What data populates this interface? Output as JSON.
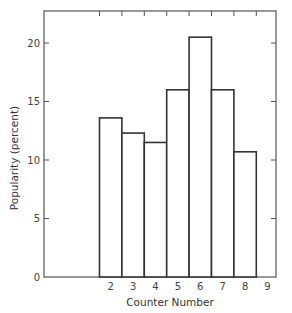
{
  "chart_data": {
    "type": "bar",
    "title": "",
    "xlabel": "Counter Number",
    "ylabel": "Popularity (percent)",
    "categories": [
      "2",
      "3",
      "4",
      "5",
      "6",
      "7",
      "8",
      "9"
    ],
    "values": [
      13.6,
      12.3,
      11.5,
      16.0,
      20.5,
      16.0,
      10.7,
      null
    ],
    "ylim": [
      0,
      23
    ],
    "yticks": [
      0,
      5,
      10,
      15,
      20
    ],
    "grid": false,
    "legend": null,
    "style": {
      "bar_fill": "#ffffff",
      "bar_stroke": "#333333",
      "axis_color": "#555555"
    }
  }
}
